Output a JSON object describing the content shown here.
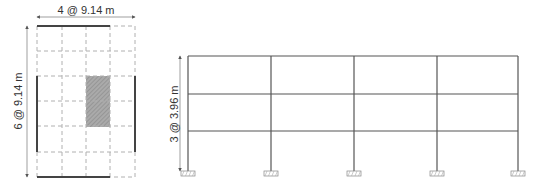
{
  "plan_view": {
    "bays_x": 4,
    "bays_y": 6,
    "dimension_x_label": "4 @ 9.14 m",
    "dimension_y_label": "6 @ 9.14 m",
    "grid_x": [
      37,
      62,
      86,
      110,
      135
    ],
    "grid_y": [
      26,
      51,
      76,
      101,
      126,
      152,
      177
    ],
    "hatched_area": {
      "x1": 86,
      "x2": 110,
      "y1": 76,
      "y2": 127
    }
  },
  "elevation_view": {
    "stories": 3,
    "bays": 4,
    "dimension_label": "3 @ 3.96 m",
    "columns_x": [
      188,
      271,
      354,
      437,
      518
    ],
    "floors_y": [
      56,
      94,
      131
    ],
    "base_y": 171
  },
  "colors": {
    "frame": "#555555",
    "grid": "#b0b0b0",
    "thick_wall": "#444444",
    "hatch": "#999999",
    "text": "#333333"
  }
}
